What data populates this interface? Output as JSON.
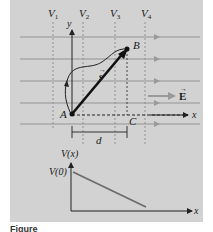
{
  "figure": {
    "equipotentials": [
      "V1",
      "V2",
      "V3",
      "V4"
    ],
    "equipotential_labels": [
      {
        "main": "V",
        "sub": "1"
      },
      {
        "main": "V",
        "sub": "2"
      },
      {
        "main": "V",
        "sub": "3"
      },
      {
        "main": "V",
        "sub": "4"
      }
    ],
    "field_label": "E",
    "displacement_label": "s",
    "points": {
      "A": "A",
      "B": "B",
      "C": "C"
    },
    "distance_label": "d",
    "axes": {
      "x": "x",
      "y": "y"
    },
    "lower_graph": {
      "ylabel": "V(x)",
      "y0_label": "V(0)",
      "xlabel": "x"
    },
    "caption": "Figure"
  },
  "colors": {
    "panel_bg": "#d2d2d2",
    "field_lines": "#a8a8a8",
    "equipotential_lines": "#8a8a8a",
    "axis": "#222222",
    "graph_line": "#6a6a6a"
  }
}
